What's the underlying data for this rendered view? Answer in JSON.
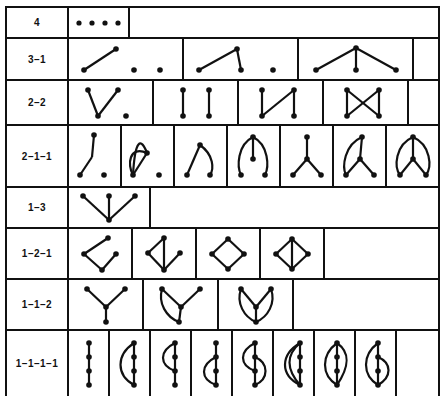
{
  "figure": {
    "type": "table",
    "background_color": "#ffffff",
    "line_color": "#111111",
    "border_width_px": 2,
    "width_px": 446,
    "height_px": 403,
    "label_column_width_px": 62
  },
  "rows": [
    {
      "label": "4",
      "row_height_px": 31,
      "cell_width_px": 61,
      "diagram_count": 1,
      "diagrams": [
        "four-isolated-points"
      ]
    },
    {
      "label": "3–1",
      "row_height_px": 42,
      "cell_width_px": 115,
      "diagram_count": 3,
      "diagrams": [
        "one-edge-two-points",
        "path-two-edges-one-point",
        "star-three-edges"
      ]
    },
    {
      "label": "2–2",
      "row_height_px": 45,
      "cell_width_px": 85,
      "diagram_count": 4,
      "diagrams": [
        "bent-path-two-edges-point",
        "two-parallel-edges",
        "zigzag-path",
        "bowtie-crossing"
      ]
    },
    {
      "label": "2–1–1",
      "row_height_px": 62,
      "cell_width_px": 53,
      "diagram_count": 7,
      "diagrams": [
        "bent-edge-pair-point",
        "loop-with-point",
        "curve-and-segment",
        "theta-open-fan",
        "three-leg-star",
        "arc-star-left",
        "double-arc-star"
      ]
    },
    {
      "label": "1–3",
      "row_height_px": 41,
      "cell_width_px": 82,
      "diagram_count": 1,
      "diagrams": [
        "downward-three-star"
      ]
    },
    {
      "label": "1–2–1",
      "row_height_px": 51,
      "cell_width_px": 64,
      "diagram_count": 4,
      "diagrams": [
        "open-chevron-path",
        "chevron-with-stem",
        "open-diamond",
        "diamond-with-diagonal"
      ]
    },
    {
      "label": "1–1–2",
      "row_height_px": 51,
      "cell_width_px": 75,
      "diagram_count": 3,
      "diagrams": [
        "y-star",
        "y-star-one-arc",
        "y-star-two-arcs"
      ]
    },
    {
      "label": "1–1–1–1",
      "row_height_px": 65,
      "cell_width_px": 41,
      "diagram_count": 8,
      "diagrams": [
        "straight-chain-four",
        "chain-with-left-arc",
        "chain-with-small-arc",
        "chain-with-lower-arc",
        "chain-with-s-arc",
        "chain-with-double-left-arc",
        "chain-with-lens",
        "chain-with-wide-lens"
      ]
    }
  ]
}
